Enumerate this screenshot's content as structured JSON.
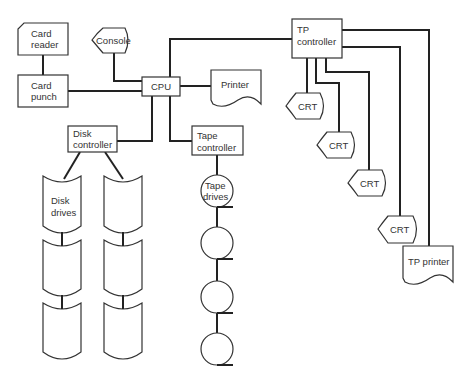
{
  "diagram": {
    "nodes": {
      "card_reader": {
        "line1": "Card",
        "line2": "reader"
      },
      "card_punch": {
        "line1": "Card",
        "line2": "punch"
      },
      "console": {
        "label": "Console"
      },
      "cpu": {
        "label": "CPU"
      },
      "printer": {
        "label": "Printer"
      },
      "tp_controller": {
        "line1": "TP",
        "line2": "controller"
      },
      "disk_controller": {
        "line1": "Disk",
        "line2": "controller"
      },
      "tape_controller": {
        "line1": "Tape",
        "line2": "controller"
      },
      "disk_drives": {
        "line1": "Disk",
        "line2": "drives",
        "count": 6
      },
      "tape_drives": {
        "line1": "Tape",
        "line2": "drives",
        "count": 4
      },
      "crts": [
        {
          "label": "CRT"
        },
        {
          "label": "CRT"
        },
        {
          "label": "CRT"
        },
        {
          "label": "CRT"
        }
      ],
      "tp_printer": {
        "label": "TP printer"
      }
    },
    "edges": [
      [
        "card_reader",
        "card_punch"
      ],
      [
        "card_punch",
        "cpu"
      ],
      [
        "console",
        "cpu"
      ],
      [
        "cpu",
        "printer"
      ],
      [
        "cpu",
        "tp_controller"
      ],
      [
        "cpu",
        "disk_controller"
      ],
      [
        "cpu",
        "tape_controller"
      ],
      [
        "disk_controller",
        "disk_drives"
      ],
      [
        "tape_controller",
        "tape_drives"
      ],
      [
        "tp_controller",
        "crt_1"
      ],
      [
        "tp_controller",
        "crt_2"
      ],
      [
        "tp_controller",
        "crt_3"
      ],
      [
        "tp_controller",
        "crt_4"
      ],
      [
        "tp_controller",
        "tp_printer"
      ]
    ]
  }
}
